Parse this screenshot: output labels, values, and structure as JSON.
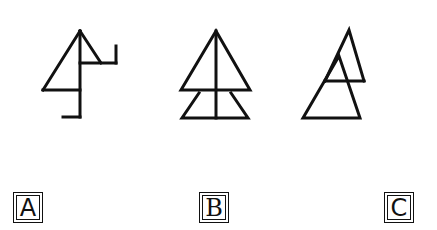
{
  "figures": [
    {
      "id": "A",
      "label": "A",
      "description": "triangle with vertical stem, left hook at bottom, right flag at top"
    },
    {
      "id": "B",
      "label": "B",
      "description": "triangle over trapezoid with central vertical line"
    },
    {
      "id": "C",
      "label": "C",
      "description": "two overlapping triangles, upper one offset right"
    }
  ],
  "colors": {
    "stroke": "#111111",
    "background": "#ffffff"
  }
}
